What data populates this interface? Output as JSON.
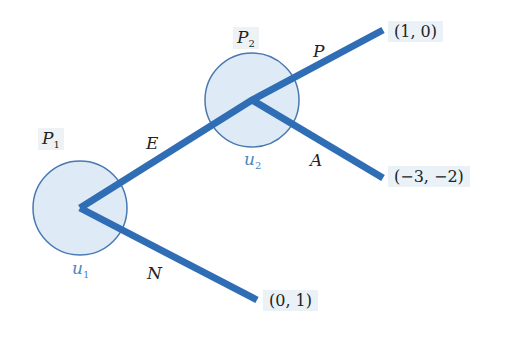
{
  "diagram": {
    "type": "game-tree",
    "colors": {
      "edge": "#2f6db5",
      "node_fill": "#deebf7",
      "node_stroke": "#4a78b0",
      "payoff_bg": "#eaf2f8",
      "utility_text": "#4a86c0"
    },
    "nodes": [
      {
        "id": "n1",
        "player": "P",
        "player_sub": "1",
        "utility": "u",
        "utility_sub": "1"
      },
      {
        "id": "n2",
        "player": "P",
        "player_sub": "2",
        "utility": "u",
        "utility_sub": "2"
      }
    ],
    "edges": [
      {
        "from": "n1",
        "to": "n2",
        "label": "E"
      },
      {
        "from": "n1",
        "to": "leaf_N",
        "label": "N"
      },
      {
        "from": "n2",
        "to": "leaf_P",
        "label": "P"
      },
      {
        "from": "n2",
        "to": "leaf_A",
        "label": "A"
      }
    ],
    "payoffs": {
      "leaf_P": "(1, 0)",
      "leaf_A": "(−3, −2)",
      "leaf_N": "(0, 1)"
    }
  }
}
